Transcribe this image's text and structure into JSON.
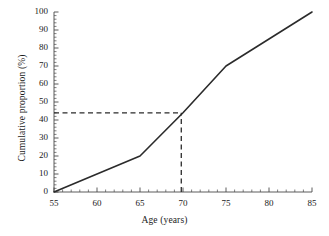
{
  "chart_data": {
    "type": "line",
    "title": "",
    "xlabel": "Age (years)",
    "ylabel": "Cumulative proportion (%)",
    "xlim": [
      55,
      85
    ],
    "ylim": [
      0,
      100
    ],
    "xticks": [
      55,
      60,
      65,
      70,
      75,
      80,
      85
    ],
    "yticks": [
      0,
      10,
      20,
      30,
      40,
      50,
      60,
      70,
      80,
      90,
      100
    ],
    "xtick_labels": [
      "55",
      "60",
      "65",
      "70",
      "75",
      "80",
      "85"
    ],
    "ytick_labels": [
      "0",
      "10",
      "20",
      "30",
      "40",
      "50",
      "60",
      "70",
      "80",
      "90",
      "100"
    ],
    "x_minor_tick_step": 1,
    "y_minor_tick_step": 2,
    "grid": false,
    "legend": false,
    "series": [
      {
        "name": "Cumulative proportion",
        "x": [
          55,
          65,
          70,
          75,
          85
        ],
        "values": [
          0,
          20,
          44,
          70,
          100
        ],
        "color": "#2b2b2b",
        "line_width": 1.6,
        "style": "solid"
      }
    ],
    "annotations": [
      {
        "name": "median-reference-horizontal",
        "type": "dashed-line",
        "orientation": "horizontal",
        "y": 44,
        "x_from": 55,
        "x_to": 69.8,
        "color": "#2b2b2b"
      },
      {
        "name": "median-reference-vertical",
        "type": "dashed-line",
        "orientation": "vertical",
        "x": 69.8,
        "y_from": 0,
        "y_to": 44,
        "color": "#2b2b2b"
      }
    ]
  },
  "figure": {
    "axis_color": "#4a4a4a",
    "line_color": "#2b2b2b",
    "background": "#ffffff"
  }
}
